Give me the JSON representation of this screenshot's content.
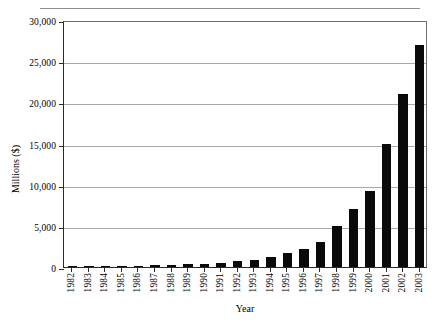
{
  "chart_data": {
    "type": "bar",
    "title": "",
    "xlabel": "Year",
    "ylabel": "Millions ($)",
    "ylim": [
      0,
      30000
    ],
    "ytick_values": [
      0,
      5000,
      10000,
      15000,
      20000,
      25000,
      30000
    ],
    "ytick_labels": [
      "0",
      "5,000",
      "10,000",
      "15,000",
      "20,000",
      "25,000",
      "30,000"
    ],
    "grid": true,
    "legend": "none",
    "bar_color": "#0a0a0a",
    "categories": [
      "1982",
      "1983",
      "1984",
      "1985",
      "1986",
      "1987",
      "1988",
      "1989",
      "1990",
      "1991",
      "1992",
      "1993",
      "1994",
      "1995",
      "1996",
      "1997",
      "1998",
      "1999",
      "2000",
      "2001",
      "2002",
      "2003"
    ],
    "values": [
      40,
      60,
      80,
      110,
      160,
      200,
      250,
      320,
      420,
      520,
      700,
      900,
      1200,
      1700,
      2200,
      3000,
      5000,
      7000,
      9200,
      15000,
      21000,
      27000
    ]
  },
  "figure": {
    "top_caption": ""
  }
}
